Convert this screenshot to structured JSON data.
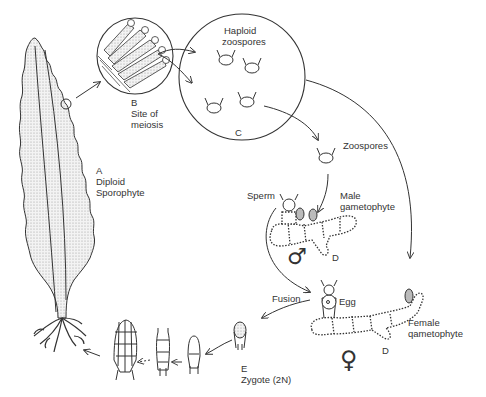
{
  "diagram": {
    "labels": {
      "sporophyte": {
        "letter": "A",
        "line1": "Diploid",
        "line2": "Sporophyte"
      },
      "meiosis": {
        "letter": "B",
        "line1": "Site of",
        "line2": "meiosis"
      },
      "haploid": {
        "line1": "Haploid",
        "line2": "zoospores",
        "letter": "C"
      },
      "zoospores": "Zoospores",
      "sperm": "Sperm",
      "male": {
        "line1": "Male",
        "line2": "gametophyte",
        "letter": "D",
        "symbol": "♂"
      },
      "fusion": "Fusion",
      "egg": "Egg",
      "female": {
        "line1": "Female",
        "line2": "qametophyte",
        "letter": "D",
        "symbol": "♀"
      },
      "zygote": {
        "letter": "E",
        "line1": "Zygote (2N)"
      }
    },
    "colors": {
      "ink": "#333333",
      "stipple": "#d8d8d8",
      "background": "#ffffff"
    }
  }
}
